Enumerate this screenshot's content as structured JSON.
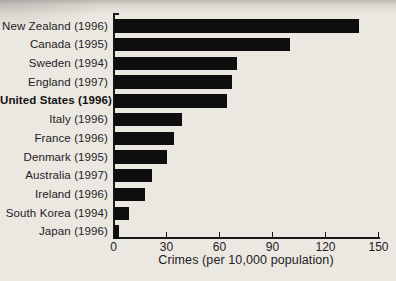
{
  "figure": {
    "background_color": "#ebe8e1",
    "bar_color": "#0e0e0f",
    "text_color": "#23211e"
  },
  "chart_data": {
    "type": "bar",
    "orientation": "horizontal",
    "title": "",
    "xlabel": "Crimes (per 10,000 population)",
    "ylabel": "",
    "xlim": [
      0,
      150
    ],
    "xticks": [
      0,
      30,
      60,
      90,
      120,
      150
    ],
    "grid": false,
    "legend": false,
    "categories": [
      "New Zealand (1996)",
      "Canada (1995)",
      "Sweden (1994)",
      "England (1997)",
      "United States (1996)",
      "Italy (1996)",
      "France (1996)",
      "Denmark (1995)",
      "Australia (1997)",
      "Ireland (1996)",
      "South Korea (1994)",
      "Japan (1996)"
    ],
    "values": [
      139,
      100,
      70,
      67,
      64,
      39,
      34,
      30,
      22,
      18,
      9,
      3
    ],
    "emphasized_category": "United States (1996)"
  }
}
